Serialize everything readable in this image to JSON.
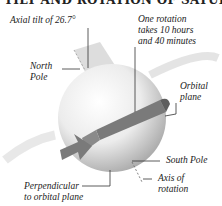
{
  "title": "TILT AND ROTATION OF SATURN",
  "labels": {
    "axial_tilt": "Axial tilt of 26.7°",
    "rotation_line1": "One rotation",
    "rotation_line2": "takes 10 hours",
    "rotation_line3": "and 40 minutes",
    "north_pole_line1": "North",
    "north_pole_line2": "Pole",
    "orbital_plane_line1": "Orbital",
    "orbital_plane_line2": "plane",
    "south_pole": "South Pole",
    "axis_line1": "Axis of",
    "axis_line2": "rotation",
    "perpendicular_line1": "Perpendicular",
    "perpendicular_line2": "to orbital plane"
  },
  "colors": {
    "planet_light": "#fafafa",
    "planet_shadow": "#b8b8b8",
    "arrow": "#7a7a7a",
    "ring": "#dcdcdc",
    "text": "#222222"
  }
}
